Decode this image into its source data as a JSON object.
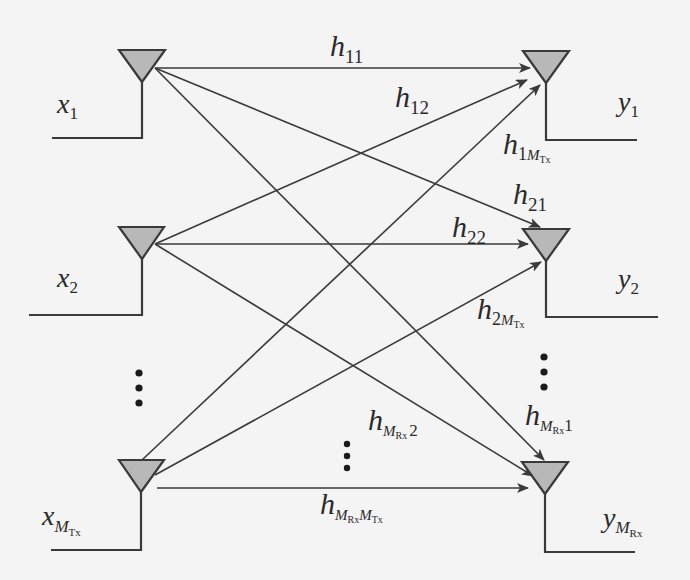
{
  "diagram": {
    "colors": {
      "background": "#f4f4f4",
      "line": "#3a3a3a",
      "antenna_fill": "#b8b8b8",
      "text": "#2a2a2a"
    },
    "transmitters": [
      {
        "id": "tx1",
        "label_main": "x",
        "label_sub": "1",
        "label_subsub": ""
      },
      {
        "id": "tx2",
        "label_main": "x",
        "label_sub": "2",
        "label_subsub": ""
      },
      {
        "id": "txM",
        "label_main": "x",
        "label_sub": "M",
        "label_subsub": "Tx"
      }
    ],
    "receivers": [
      {
        "id": "rx1",
        "label_main": "y",
        "label_sub": "1",
        "label_subsub": ""
      },
      {
        "id": "rx2",
        "label_main": "y",
        "label_sub": "2",
        "label_subsub": ""
      },
      {
        "id": "rxM",
        "label_main": "y",
        "label_sub": "M",
        "label_subsub": "Rx"
      }
    ],
    "channels": {
      "h11": {
        "main": "h",
        "sub": "11"
      },
      "h12": {
        "main": "h",
        "sub": "12"
      },
      "h1M": {
        "main": "h",
        "sub_a": "1",
        "sub_b": "M",
        "sub_b_sub": "Tx"
      },
      "h21": {
        "main": "h",
        "sub": "21"
      },
      "h22": {
        "main": "h",
        "sub": "22"
      },
      "h2M": {
        "main": "h",
        "sub_a": "2",
        "sub_b": "M",
        "sub_b_sub": "Tx"
      },
      "hM1": {
        "main": "h",
        "sub_a": "M",
        "sub_a_sub": "Rx",
        "sub_b": "1"
      },
      "hM2": {
        "main": "h",
        "sub_a": "M",
        "sub_a_sub": "Rx",
        "sub_b": "2"
      },
      "hMM": {
        "main": "h",
        "sub_a": "M",
        "sub_a_sub": "Rx",
        "sub_b": "M",
        "sub_b_sub": "Tx"
      }
    },
    "ellipsis": {
      "tx_side": "vertical-dots",
      "rx_side": "vertical-dots",
      "middle": "vertical-dots"
    }
  }
}
